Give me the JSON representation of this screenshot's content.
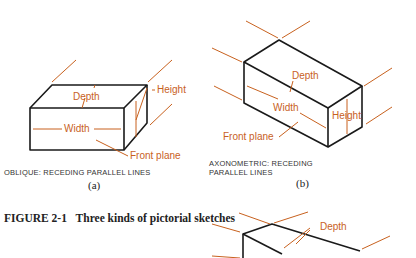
{
  "figure": {
    "number": "FIGURE 2-1",
    "title": "Three kinds of pictorial sketches"
  },
  "panels": [
    {
      "id": "a",
      "sublabel": "(a)",
      "caption": "OBLIQUE: RECEDING PARALLEL LINES",
      "labels": {
        "depth": "Depth",
        "width": "Width",
        "height": "Height",
        "front_plane": "Front plane"
      }
    },
    {
      "id": "b",
      "sublabel": "(b)",
      "caption_line1": "AXONOMETRIC: RECEDING",
      "caption_line2": "PARALLEL LINES",
      "labels": {
        "depth": "Depth",
        "width": "Width",
        "height": "Height",
        "front_plane": "Front plane"
      }
    },
    {
      "id": "c",
      "labels": {
        "depth": "Depth"
      }
    }
  ],
  "colors": {
    "line": "#1a1a1a",
    "accent": "#c8611e"
  }
}
